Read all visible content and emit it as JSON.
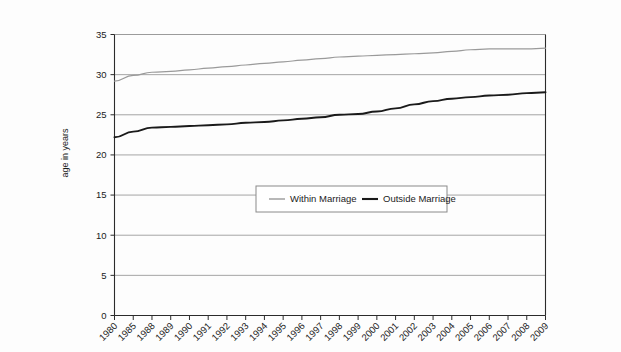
{
  "chart_data": {
    "type": "line",
    "title": "",
    "subtitle": "",
    "xlabel": "",
    "ylabel": "age in years",
    "ylim": [
      0,
      35
    ],
    "yticks": [
      0,
      5,
      10,
      15,
      20,
      25,
      30,
      35
    ],
    "grid": true,
    "legend_position": "center",
    "categories": [
      "1980",
      "1985",
      "1988",
      "1989",
      "1990",
      "1991",
      "1992",
      "1993",
      "1994",
      "1995",
      "1996",
      "1997",
      "1998",
      "1999",
      "2000",
      "2001",
      "2002",
      "2003",
      "2004",
      "2005",
      "2006",
      "2007",
      "2008",
      "2009"
    ],
    "series": [
      {
        "name": "Within Marriage",
        "color": "#9a9a9a",
        "values": [
          29.2,
          29.9,
          30.3,
          30.4,
          30.6,
          30.8,
          31.0,
          31.2,
          31.4,
          31.6,
          31.8,
          32.0,
          32.2,
          32.3,
          32.4,
          32.5,
          32.6,
          32.7,
          32.9,
          33.1,
          33.2,
          33.2,
          33.2,
          33.3
        ]
      },
      {
        "name": "Outside Marriage",
        "color": "#1a1a1a",
        "values": [
          22.2,
          22.9,
          23.4,
          23.5,
          23.6,
          23.7,
          23.8,
          24.0,
          24.1,
          24.3,
          24.5,
          24.7,
          25.0,
          25.1,
          25.4,
          25.8,
          26.3,
          26.7,
          27.0,
          27.2,
          27.4,
          27.5,
          27.7,
          27.8
        ]
      }
    ],
    "axis_color": "#2b2b2b",
    "grid_color": "#9b9b9b",
    "legend_border_color": "#8a8a8a",
    "background_color": "#fdfdfd"
  },
  "legend": {
    "items": [
      {
        "label": "Within Marriage",
        "swatch_name": "legend-swatch-within-marriage"
      },
      {
        "label": "Outside Marriage",
        "swatch_name": "legend-swatch-outside-marriage"
      }
    ]
  },
  "axes": {
    "y_axis_title": "age in years"
  }
}
